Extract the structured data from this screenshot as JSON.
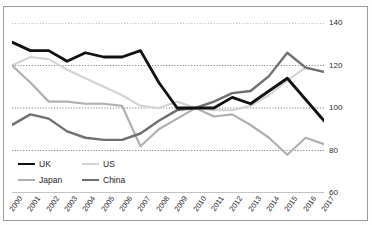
{
  "title_fragment": "",
  "legend": {
    "items": [
      {
        "label": "UK",
        "color": "#111111",
        "width": 2.8
      },
      {
        "label": "US",
        "color": "#d4d4d4",
        "width": 2.2
      },
      {
        "label": "Japan",
        "color": "#b0b0b0",
        "width": 2.2
      },
      {
        "label": "China",
        "color": "#6f6f6f",
        "width": 2.4
      }
    ]
  },
  "axis": {
    "y_ticks": [
      "140",
      "120",
      "100",
      "80",
      "60"
    ],
    "y_values": [
      140,
      120,
      100,
      80,
      60
    ]
  },
  "chart_data": {
    "type": "line",
    "title": "",
    "xlabel": "",
    "ylabel": "",
    "ylim": [
      60,
      140
    ],
    "grid": true,
    "legend_position": "bottom-left",
    "y_axis_side": "right",
    "categories": [
      "2000",
      "2001",
      "2002",
      "2003",
      "2004",
      "2005",
      "2006",
      "2007",
      "2008",
      "2009",
      "2010",
      "2011",
      "2012",
      "2013",
      "2014",
      "2015",
      "2016",
      "2017"
    ],
    "series": [
      {
        "name": "UK",
        "color": "#111111",
        "width": 2.8,
        "values": [
          131,
          127,
          127,
          122,
          126,
          124,
          124,
          127,
          112,
          100,
          100,
          100,
          105,
          102,
          108,
          114,
          104,
          94
        ]
      },
      {
        "name": "US",
        "color": "#d4d4d4",
        "width": 2.2,
        "values": [
          120,
          124,
          123,
          118,
          114,
          110,
          106,
          101,
          100,
          103,
          100,
          99,
          99,
          101,
          106,
          113,
          119,
          117
        ]
      },
      {
        "name": "Japan",
        "color": "#b0b0b0",
        "width": 2.2,
        "values": [
          120,
          112,
          103,
          103,
          102,
          102,
          101,
          82,
          90,
          95,
          100,
          96,
          97,
          92,
          86,
          78,
          86,
          83
        ]
      },
      {
        "name": "China",
        "color": "#6f6f6f",
        "width": 2.4,
        "values": [
          92,
          97,
          95,
          89,
          86,
          85,
          85,
          88,
          94,
          99,
          100,
          103,
          107,
          108,
          115,
          126,
          119,
          117
        ]
      }
    ]
  }
}
